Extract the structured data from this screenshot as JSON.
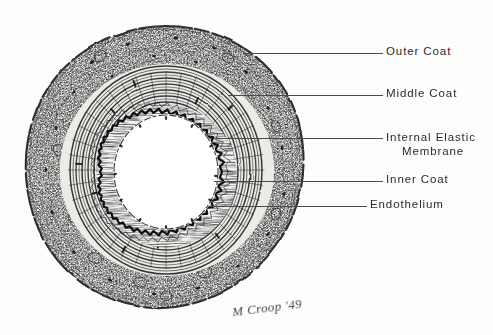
{
  "figure": {
    "medium": "pen-and-ink histological drawing",
    "background_color": "#fdfdfc",
    "ink_color": "#2b2b2b"
  },
  "labels": [
    {
      "id": "outer-coat",
      "text": "Outer Coat",
      "line1": "Outer Coat",
      "line2": "",
      "text_x": 386,
      "text_y": 45,
      "leader": {
        "x1": 243,
        "y1": 53,
        "x2": 383,
        "y2": 53
      }
    },
    {
      "id": "middle-coat",
      "text": "Middle Coat",
      "line1": "Middle Coat",
      "line2": "",
      "text_x": 386,
      "text_y": 87,
      "leader": {
        "x1": 228,
        "y1": 95,
        "x2": 383,
        "y2": 95
      }
    },
    {
      "id": "internal-elastic-membrane",
      "text": "Internal Elastic Membrane",
      "line1": "Internal Elastic",
      "line2": "Membrane",
      "text_x": 386,
      "text_y": 130,
      "leader": {
        "x1": 216,
        "y1": 138,
        "x2": 383,
        "y2": 138
      }
    },
    {
      "id": "inner-coat",
      "text": "Inner Coat",
      "line1": "Inner Coat",
      "line2": "",
      "text_x": 386,
      "text_y": 173,
      "leader": {
        "x1": 214,
        "y1": 181,
        "x2": 383,
        "y2": 181
      }
    },
    {
      "id": "endothelium",
      "text": "Endothelium",
      "line1": "Endothelium",
      "line2": "",
      "text_x": 370,
      "text_y": 198,
      "leader": {
        "x1": 210,
        "y1": 206,
        "x2": 367,
        "y2": 206
      }
    }
  ],
  "signature": {
    "text": "M Croop '49",
    "x": 232,
    "y": 300
  },
  "anatomy": {
    "center_x": 166,
    "center_y": 168,
    "outer_coat_label": "Outer Coat",
    "middle_coat_label": "Middle Coat",
    "internal_elastic_membrane_label": "Internal Elastic Membrane",
    "inner_coat_label": "Inner Coat",
    "endothelium_label": "Endothelium",
    "lumen_label": "Lumen",
    "radii": {
      "outer_coat_outer": 142,
      "outer_coat_inner": 103,
      "middle_coat_outer": 103,
      "middle_coat_inner": 62,
      "internal_elastic_membrane": 58,
      "lumen": 52
    }
  }
}
